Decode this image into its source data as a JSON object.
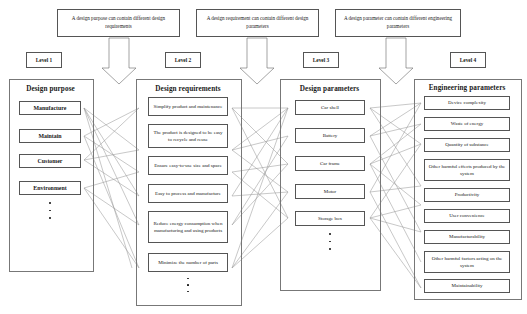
{
  "notes": [
    {
      "id": "note-purpose-requirements",
      "text": "A design purpose can contain different design requirements"
    },
    {
      "id": "note-requirement-parameters",
      "text": "A design requirement can contain different design parameters"
    },
    {
      "id": "note-parameter-engineering",
      "text": "A design parameter can contain different engineering parameters"
    }
  ],
  "levels": [
    {
      "id": "level-1",
      "label": "Level 1"
    },
    {
      "id": "level-2",
      "label": "Level 2"
    },
    {
      "id": "level-3",
      "label": "Level 3"
    },
    {
      "id": "level-4",
      "label": "Level 4"
    }
  ],
  "columns": {
    "design_purpose": {
      "title": "Design purpose",
      "items": [
        "Manufacture",
        "Maintain",
        "Customer",
        "Environment"
      ],
      "ellipsis": true
    },
    "design_requirements": {
      "title": "Design requirements",
      "items": [
        "Simplify  product and maintenance",
        "The product is designed to be easy to recycle and reuse",
        "Ensure easy-to-use size and space",
        "Easy to process and manufacture",
        "Reduce energy consumption when manufacturing and using products",
        "Minimize  the number of parts"
      ],
      "ellipsis": true
    },
    "design_parameters": {
      "title": "Design parameters",
      "items": [
        "Car shell",
        "Battery",
        "Car frame",
        "Motor",
        "Storage box"
      ],
      "ellipsis": true
    },
    "engineering_parameters": {
      "title": "Engineering parameters",
      "items": [
        "Device complexity",
        "Waste of energy",
        "Quantity  of substance",
        "Other harmful effects produced by the system",
        "Productivity",
        "User convenience",
        "Manufacturability",
        "Other harmful factors acting on the system",
        "Maintainability"
      ],
      "ellipsis": true
    }
  },
  "colors": {
    "box_border": "#555555",
    "panel_border": "#777777",
    "wire": "#9a9a9a",
    "arrow_fill": "#ffffff",
    "arrow_border": "#666666",
    "text": "#1a1a1a"
  }
}
